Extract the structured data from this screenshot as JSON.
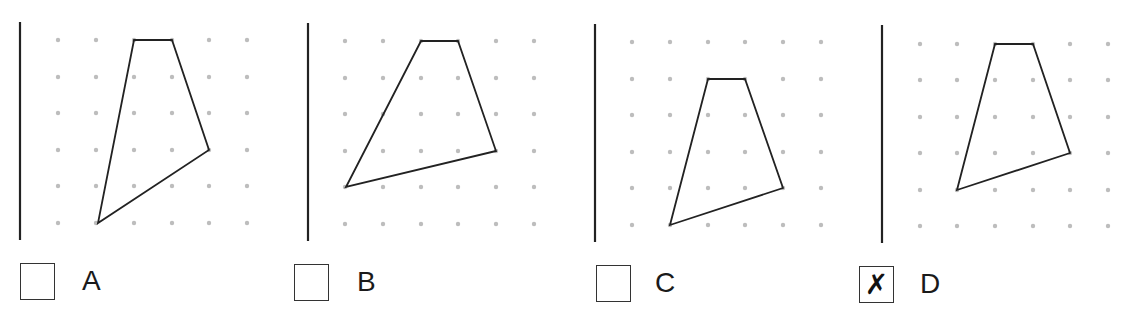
{
  "question": {
    "options": [
      {
        "id": "A",
        "label": "A",
        "checked": false,
        "axis_line": {
          "x": 20,
          "y1": 22,
          "y2": 240
        },
        "grid": {
          "xs": [
            58,
            96,
            134,
            172,
            209,
            247
          ],
          "ys": [
            40,
            77,
            113,
            150,
            186,
            223
          ]
        },
        "polygon": [
          [
            134,
            40
          ],
          [
            172,
            40
          ],
          [
            209,
            150
          ],
          [
            98,
            223
          ]
        ],
        "checkbox": {
          "x": 20,
          "y": 263
        },
        "label_pos": {
          "x": 82,
          "y": 267
        }
      },
      {
        "id": "B",
        "label": "B",
        "checked": false,
        "axis_line": {
          "x": 308,
          "y1": 23,
          "y2": 241
        },
        "grid": {
          "xs": [
            345,
            383,
            421,
            458,
            496,
            534
          ],
          "ys": [
            41,
            78,
            114,
            151,
            187,
            224
          ]
        },
        "polygon": [
          [
            421,
            41
          ],
          [
            458,
            41
          ],
          [
            496,
            151
          ],
          [
            346,
            187
          ]
        ],
        "checkbox": {
          "x": 294,
          "y": 264
        },
        "label_pos": {
          "x": 357,
          "y": 268
        }
      },
      {
        "id": "C",
        "label": "C",
        "checked": false,
        "axis_line": {
          "x": 595,
          "y1": 24,
          "y2": 242
        },
        "grid": {
          "xs": [
            632,
            670,
            708,
            745,
            783,
            821
          ],
          "ys": [
            42,
            79,
            115,
            152,
            188,
            225
          ]
        },
        "polygon": [
          [
            708,
            79
          ],
          [
            745,
            79
          ],
          [
            783,
            188
          ],
          [
            670,
            225
          ]
        ],
        "checkbox": {
          "x": 596,
          "y": 265
        },
        "label_pos": {
          "x": 655,
          "y": 269
        }
      },
      {
        "id": "D",
        "label": "D",
        "checked": true,
        "mark": "✗",
        "axis_line": {
          "x": 882,
          "y1": 25,
          "y2": 243
        },
        "grid": {
          "xs": [
            920,
            957,
            995,
            1033,
            1070,
            1108
          ],
          "ys": [
            44,
            80,
            117,
            153,
            190,
            226
          ]
        },
        "polygon": [
          [
            995,
            44
          ],
          [
            1033,
            44
          ],
          [
            1070,
            153
          ],
          [
            957,
            190
          ]
        ],
        "checkbox": {
          "x": 859,
          "y": 266
        },
        "label_pos": {
          "x": 920,
          "y": 270
        }
      }
    ]
  },
  "colors": {
    "line": "#222222",
    "dot": "#bdbdbd",
    "text": "#1a1a1a"
  }
}
